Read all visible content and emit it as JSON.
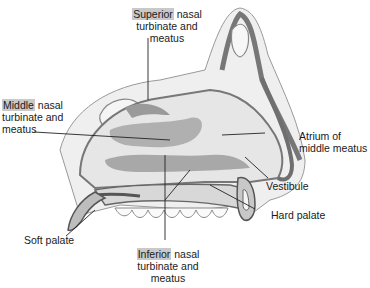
{
  "diagram": {
    "type": "anatomical illustration",
    "colors": {
      "mucosa": "#8f8f8f",
      "cavity": "#e6e6e6",
      "bone": "#efefef",
      "highlight": "#c9c9c9",
      "line": "#222222"
    },
    "labels": {
      "superior": {
        "highlight": "Superior",
        "line1_rest": " nasal",
        "line2": "turbinate and",
        "line3": "meatus"
      },
      "middle": {
        "highlight": "Middle",
        "line1_rest": " nasal",
        "line2": "turbinate and",
        "line3": "meatus"
      },
      "atrium": {
        "line1": "Atrium of",
        "line2": "middle meatus"
      },
      "vestibule": "Vestibule",
      "hard_palate": "Hard palate",
      "soft_palate": "Soft palate",
      "inferior": {
        "highlight": "Inferior",
        "line1_rest": " nasal",
        "line2": "turbinate and",
        "line3": "meatus"
      }
    }
  }
}
